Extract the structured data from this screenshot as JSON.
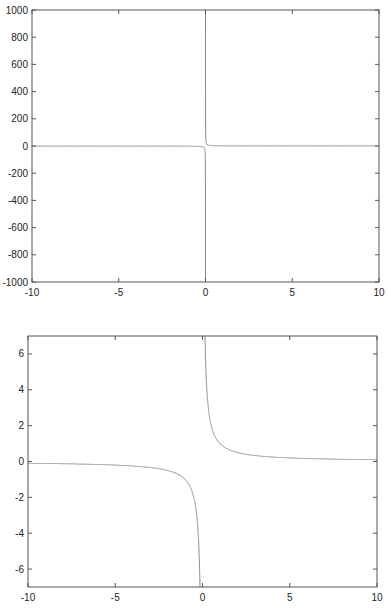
{
  "chart_data": [
    {
      "type": "line",
      "title": "",
      "xlabel": "",
      "ylabel": "",
      "function": "y = 1/x",
      "xlim": [
        -10,
        10
      ],
      "ylim": [
        -1000,
        1000
      ],
      "xticks": [
        -10,
        -5,
        0,
        5,
        10
      ],
      "yticks": [
        -1000,
        -800,
        -600,
        -400,
        -200,
        0,
        200,
        400,
        600,
        800,
        1000
      ],
      "xtick_labels": [
        "-10",
        "-5",
        "0",
        "5",
        "10"
      ],
      "ytick_labels": [
        "-1000",
        "-800",
        "-600",
        "-400",
        "-200",
        "0",
        "200",
        "400",
        "600",
        "800",
        "1000"
      ],
      "grid": false,
      "legend": null,
      "series": [
        {
          "name": "1/x",
          "x_samples": [
            -10,
            -5,
            -1,
            -0.1,
            -0.01,
            -0.001,
            0.001,
            0.01,
            0.1,
            1,
            5,
            10
          ],
          "y_samples": [
            -0.1,
            -0.2,
            -1,
            -10,
            -100,
            -1000,
            1000,
            100,
            10,
            1,
            0.2,
            0.1
          ],
          "color": "#888888"
        }
      ],
      "frame": {
        "left": 32,
        "top": 10,
        "right": 379,
        "bottom": 282
      }
    },
    {
      "type": "line",
      "title": "",
      "xlabel": "",
      "ylabel": "",
      "function": "y = 1/x",
      "xlim": [
        -10,
        10
      ],
      "ylim": [
        -7,
        7
      ],
      "xticks": [
        -10,
        -5,
        0,
        5,
        10
      ],
      "yticks": [
        -6,
        -4,
        -2,
        0,
        2,
        4,
        6
      ],
      "xtick_labels": [
        "-10",
        "-5",
        "0",
        "5",
        "10"
      ],
      "ytick_labels": [
        "-6",
        "-4",
        "-2",
        "0",
        "2",
        "4",
        "6"
      ],
      "grid": false,
      "legend": null,
      "series": [
        {
          "name": "1/x",
          "x_samples": [
            -10,
            -5,
            -2,
            -1,
            -0.5,
            -0.2,
            -0.15,
            0.15,
            0.2,
            0.5,
            1,
            2,
            5,
            10
          ],
          "y_samples": [
            -0.1,
            -0.2,
            -0.5,
            -1,
            -2,
            -5,
            -6.7,
            6.7,
            5,
            2,
            1,
            0.5,
            0.2,
            0.1
          ],
          "color": "#888888"
        }
      ],
      "frame": {
        "left": 28,
        "top": 336,
        "right": 377,
        "bottom": 587
      }
    }
  ]
}
